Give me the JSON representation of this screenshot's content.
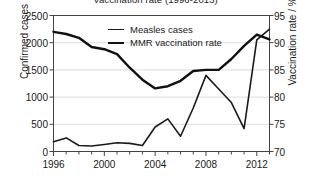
{
  "chart_data": {
    "type": "line",
    "title": "Vaccination rate (1996-2013)",
    "xlabel": "",
    "ylabel": "Confirmed cases",
    "y2label": "Vaccination rate / %",
    "grid": true,
    "legend_position": "top-center",
    "xlim": [
      1996,
      2013
    ],
    "ylim": [
      0,
      2500
    ],
    "y2lim": [
      70,
      95
    ],
    "xticks": [
      1996,
      2000,
      2004,
      2008,
      2012
    ],
    "xticks_minor": [
      1997,
      1998,
      1999,
      2001,
      2002,
      2003,
      2005,
      2006,
      2007,
      2009,
      2010,
      2011,
      2013
    ],
    "yticks": [
      0,
      500,
      1000,
      1500,
      2000,
      2500
    ],
    "y2ticks": [
      70,
      75,
      80,
      85,
      90,
      95
    ],
    "x": [
      1996,
      1997,
      1998,
      1999,
      2000,
      2001,
      2002,
      2003,
      2004,
      2005,
      2006,
      2007,
      2008,
      2009,
      2010,
      2011,
      2012,
      2013
    ],
    "series": [
      {
        "name": "Measles cases",
        "axis": "left",
        "color": "#1a1a1a",
        "width": 1.6,
        "values": [
          180,
          250,
          110,
          100,
          130,
          160,
          150,
          110,
          450,
          600,
          280,
          800,
          1400,
          1150,
          900,
          420,
          2050,
          2250
        ]
      },
      {
        "name": "MMR vaccination rate",
        "axis": "right",
        "color": "#111111",
        "width": 2.4,
        "values": [
          92.0,
          91.6,
          90.9,
          89.2,
          88.8,
          87.9,
          85.4,
          83.2,
          81.6,
          82.0,
          83.0,
          84.8,
          85.0,
          85.0,
          87.0,
          89.4,
          91.5,
          90.6
        ]
      }
    ]
  },
  "legend": {
    "items": [
      {
        "label": "Measles cases"
      },
      {
        "label": "MMR vaccination rate"
      }
    ]
  }
}
